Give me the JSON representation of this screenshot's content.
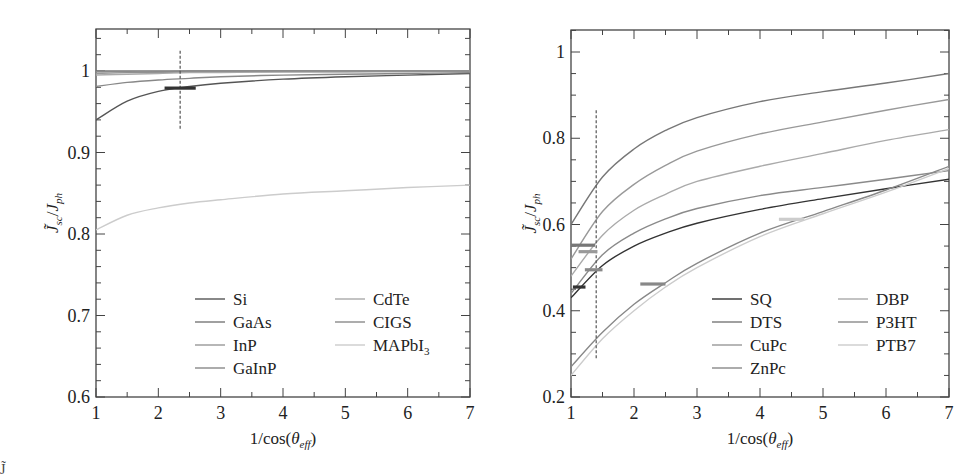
{
  "chart_data": [
    {
      "type": "line",
      "title": "",
      "xlabel": "1/cos(θ_eff)",
      "ylabel": "J̃_sc/J_ph",
      "xlim": [
        1,
        7
      ],
      "ylim": [
        0.6,
        1.05
      ],
      "xticks": [
        "1",
        "2",
        "3",
        "4",
        "5",
        "6",
        "7"
      ],
      "yticks": [
        "0.6",
        "0.7",
        "0.8",
        "0.9",
        "1"
      ],
      "grid": false,
      "legend_position": "lower right",
      "x": [
        1,
        1.5,
        2,
        2.5,
        3,
        4,
        5,
        6,
        7
      ],
      "series": [
        {
          "name": "Si",
          "color": "#555555",
          "values": [
            0.94,
            0.963,
            0.975,
            0.981,
            0.985,
            0.99,
            0.993,
            0.995,
            0.997
          ]
        },
        {
          "name": "GaAs",
          "color": "#777777",
          "values": [
            1.0,
            1.0,
            1.0,
            1.0,
            1.0,
            1.0,
            1.0,
            1.0,
            1.0
          ]
        },
        {
          "name": "InP",
          "color": "#999999",
          "values": [
            0.997,
            0.998,
            0.998,
            0.999,
            0.999,
            0.999,
            0.999,
            1.0,
            1.0
          ]
        },
        {
          "name": "GaInP",
          "color": "#888888",
          "values": [
            0.981,
            0.986,
            0.989,
            0.991,
            0.993,
            0.995,
            0.996,
            0.997,
            0.998
          ]
        },
        {
          "name": "CdTe",
          "color": "#aaaaaa",
          "values": [
            0.995,
            0.996,
            0.997,
            0.998,
            0.998,
            0.999,
            0.999,
            0.999,
            1.0
          ]
        },
        {
          "name": "CIGS",
          "color": "#8a8a8a",
          "values": [
            0.999,
            0.999,
            0.999,
            1.0,
            1.0,
            1.0,
            1.0,
            1.0,
            1.0
          ]
        },
        {
          "name": "MAPbI3",
          "color": "#cccccc",
          "values": [
            0.805,
            0.823,
            0.832,
            0.838,
            0.842,
            0.849,
            0.853,
            0.857,
            0.86
          ]
        }
      ],
      "annotations": [
        {
          "type": "vertical-dashed-line",
          "x": 2.35,
          "y_range": [
            0.928,
            1.025
          ]
        },
        {
          "type": "horizontal-bar-marker",
          "x_range": [
            2.1,
            2.6
          ],
          "y": 0.979,
          "color": "#333333"
        }
      ]
    },
    {
      "type": "line",
      "title": "",
      "xlabel": "1/cos(θ_eff)",
      "ylabel": "J̃_sc/J_ph",
      "xlim": [
        1,
        7
      ],
      "ylim": [
        0.2,
        1.05
      ],
      "xticks": [
        "1",
        "2",
        "3",
        "4",
        "5",
        "6",
        "7"
      ],
      "yticks": [
        "0.2",
        "0.4",
        "0.6",
        "0.8",
        "1"
      ],
      "grid": false,
      "legend_position": "lower right",
      "x": [
        1,
        1.5,
        2,
        2.5,
        3,
        4,
        5,
        6,
        7
      ],
      "series": [
        {
          "name": "SQ",
          "color": "#333333",
          "values": [
            0.43,
            0.505,
            0.55,
            0.58,
            0.603,
            0.635,
            0.66,
            0.683,
            0.705
          ]
        },
        {
          "name": "DTS",
          "color": "#777777",
          "values": [
            0.6,
            0.71,
            0.775,
            0.818,
            0.848,
            0.885,
            0.908,
            0.928,
            0.95
          ]
        },
        {
          "name": "CuPc",
          "color": "#999999",
          "values": [
            0.52,
            0.63,
            0.693,
            0.737,
            0.77,
            0.81,
            0.838,
            0.865,
            0.89
          ]
        },
        {
          "name": "ZnPc",
          "color": "#888888",
          "values": [
            0.27,
            0.35,
            0.415,
            0.465,
            0.51,
            0.58,
            0.63,
            0.68,
            0.735
          ]
        },
        {
          "name": "DBP",
          "color": "#aaaaaa",
          "values": [
            0.48,
            0.575,
            0.633,
            0.67,
            0.7,
            0.735,
            0.765,
            0.795,
            0.82
          ]
        },
        {
          "name": "P3HT",
          "color": "#8a8a8a",
          "values": [
            0.44,
            0.53,
            0.58,
            0.613,
            0.637,
            0.667,
            0.686,
            0.705,
            0.725
          ]
        },
        {
          "name": "PTB7",
          "color": "#cccccc",
          "values": [
            0.25,
            0.335,
            0.4,
            0.455,
            0.5,
            0.572,
            0.625,
            0.675,
            0.73
          ]
        }
      ],
      "annotations": [
        {
          "type": "vertical-dashed-line",
          "x": 1.4,
          "y_range": [
            0.29,
            0.865
          ]
        },
        {
          "type": "horizontal-bar-marker",
          "x_range": [
            1.03,
            1.23
          ],
          "y": 0.455,
          "color": "#333333"
        },
        {
          "type": "horizontal-bar-marker",
          "x_range": [
            1.0,
            1.38
          ],
          "y": 0.552,
          "color": "#777777"
        },
        {
          "type": "horizontal-bar-marker",
          "x_range": [
            1.12,
            1.42
          ],
          "y": 0.537,
          "color": "#999999"
        },
        {
          "type": "horizontal-bar-marker",
          "x_range": [
            1.22,
            1.5
          ],
          "y": 0.495,
          "color": "#888888"
        },
        {
          "type": "horizontal-bar-marker",
          "x_range": [
            2.1,
            2.5
          ],
          "y": 0.462,
          "color": "#888888"
        },
        {
          "type": "horizontal-bar-marker",
          "x_range": [
            4.3,
            4.7
          ],
          "y": 0.612,
          "color": "#cccccc"
        }
      ]
    }
  ],
  "caption_partial": "J̃"
}
